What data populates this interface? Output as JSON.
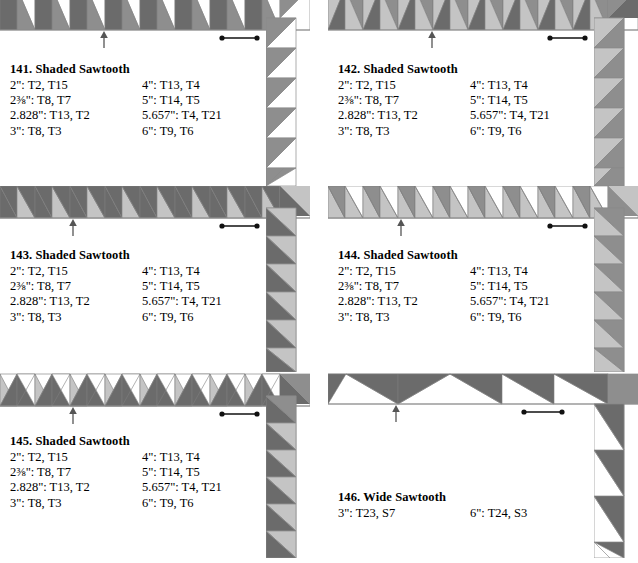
{
  "page": {
    "kind": "quilt-border-pattern-reference",
    "background_color": "#ffffff",
    "ink_color": "#000000",
    "palette": {
      "dark": "#6b6b6b",
      "medium": "#8e8e8e",
      "light": "#c4c4c4",
      "pale": "#d9d9d9",
      "white": "#ffffff",
      "outline": "#8a8a8a",
      "rule": "#909090"
    }
  },
  "blocks": [
    {
      "id": "141",
      "title": "141. Shaded Sawtooth",
      "pattern": "shaded-sawtooth-diamond",
      "marks": {
        "repeat_arrow": true,
        "repeat_bar": true
      },
      "specs_left": [
        "2\": T2, T15",
        "2⅜\": T8, T7",
        "2.828\": T13, T2",
        "3\": T8, T3"
      ],
      "specs_right": [
        "4\": T13, T4",
        "5\": T14, T5",
        "5.657\": T4, T21",
        "6\": T9, T6"
      ]
    },
    {
      "id": "142",
      "title": "142. Shaded Sawtooth",
      "pattern": "shaded-sawtooth-peak-light",
      "marks": {
        "repeat_arrow": true,
        "repeat_bar": true
      },
      "specs_left": [
        "2\": T2, T15",
        "2⅜\": T8, T7",
        "2.828\": T13, T2",
        "3\": T8, T3"
      ],
      "specs_right": [
        "4\": T13, T4",
        "5\": T14, T5",
        "5.657\": T4, T21",
        "6\": T9, T6"
      ]
    },
    {
      "id": "143",
      "title": "143. Shaded Sawtooth",
      "pattern": "shaded-sawtooth-dark-peak",
      "marks": {
        "repeat_arrow": true,
        "repeat_bar": true
      },
      "specs_left": [
        "2\": T2, T15",
        "2⅜\": T8, T7",
        "2.828\": T13, T2",
        "3\": T8, T3"
      ],
      "specs_right": [
        "4\": T13, T4",
        "5\": T14, T5",
        "5.657\": T4, T21",
        "6\": T9, T6"
      ]
    },
    {
      "id": "144",
      "title": "144. Shaded Sawtooth",
      "pattern": "shaded-sawtooth-open-peak",
      "marks": {
        "repeat_arrow": true,
        "repeat_bar": true
      },
      "specs_left": [
        "2\": T2, T15",
        "2⅜\": T8, T7",
        "2.828\": T13, T2",
        "3\": T8, T3"
      ],
      "specs_right": [
        "4\": T13, T4",
        "5\": T14, T5",
        "5.657\": T4, T21",
        "6\": T9, T6"
      ]
    },
    {
      "id": "145",
      "title": "145. Shaded Sawtooth",
      "pattern": "shaded-sawtooth-inverted",
      "marks": {
        "repeat_arrow": true,
        "repeat_bar": true
      },
      "specs_left": [
        "2\": T2, T15",
        "2⅜\": T8, T7",
        "2.828\": T13, T2",
        "3\": T8, T3"
      ],
      "specs_right": [
        "4\": T13, T4",
        "5\": T14, T5",
        "5.657\": T4, T21",
        "6\": T9, T6"
      ]
    },
    {
      "id": "146",
      "title": "146. Wide Sawtooth",
      "pattern": "wide-sawtooth",
      "marks": {
        "repeat_arrow": true,
        "repeat_bar": true
      },
      "specs_left": [
        "3\": T23, S7"
      ],
      "specs_right": [
        "6\": T24, S3"
      ]
    }
  ]
}
